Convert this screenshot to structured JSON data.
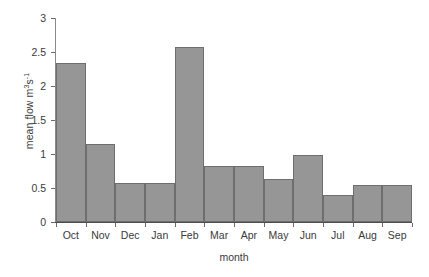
{
  "chart_data": {
    "type": "bar",
    "title": "",
    "subtitle": "",
    "xlabel": "month",
    "ylabel": "mean flow m³s⁻¹",
    "ylabel_base": "mean flow m",
    "ylabel_sup1": "3",
    "ylabel_mid": "s",
    "ylabel_sup2": "-1",
    "categories": [
      "Oct",
      "Nov",
      "Dec",
      "Jan",
      "Feb",
      "Mar",
      "Apr",
      "May",
      "Jun",
      "Jul",
      "Aug",
      "Sep"
    ],
    "values": [
      2.34,
      1.15,
      0.57,
      0.57,
      2.57,
      0.82,
      0.82,
      0.63,
      0.98,
      0.39,
      0.54,
      0.54
    ],
    "ylim": [
      0,
      3
    ],
    "yticks": [
      0,
      0.5,
      1,
      1.5,
      2,
      2.5,
      3
    ],
    "ytick_labels": [
      "0",
      "0.5",
      "1",
      "1.5",
      "2",
      "2.5",
      "3"
    ],
    "grid": false,
    "legend": false,
    "legend_position": "none",
    "bar_color": "#969696",
    "bar_edge_color": "#6e6e6e",
    "axis_color": "#4d4d4d",
    "text_color": "#3a3a3a",
    "background": "#ffffff"
  }
}
